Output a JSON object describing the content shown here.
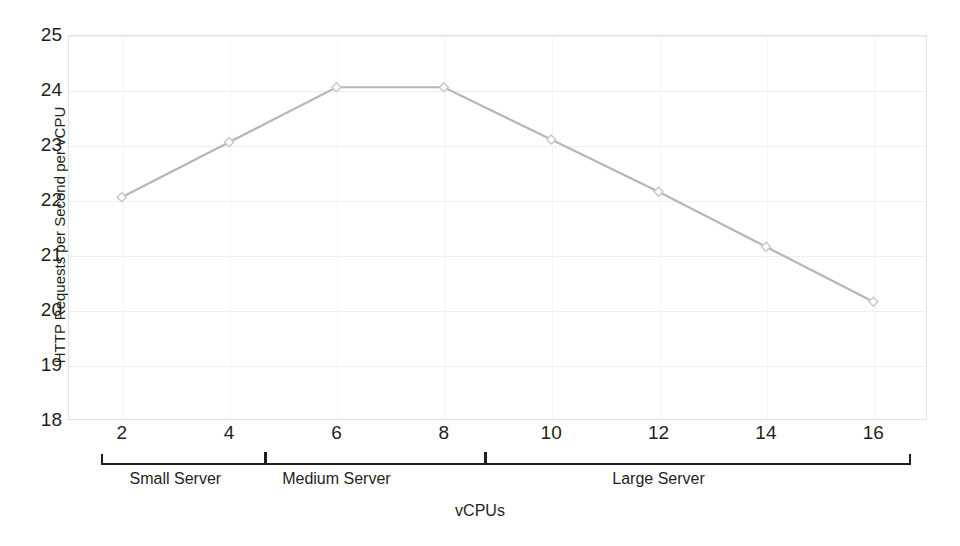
{
  "chart_data": {
    "type": "line",
    "title": "",
    "subtitle": "",
    "xlabel": "vCPUs",
    "ylabel": "HTTP Requests per Second per vCPU",
    "x": [
      2,
      4,
      6,
      8,
      10,
      12,
      14,
      16
    ],
    "values": [
      22.05,
      23.05,
      24.05,
      24.05,
      23.1,
      22.15,
      21.15,
      20.15
    ],
    "series": [
      {
        "name": "HTTP Requests per Second per vCPU",
        "values": [
          22.05,
          23.05,
          24.05,
          24.05,
          23.1,
          22.15,
          21.15,
          20.15
        ]
      }
    ],
    "xtick_labels": [
      "2",
      "4",
      "6",
      "8",
      "10",
      "12",
      "14",
      "16"
    ],
    "ytick_labels": [
      "25",
      "24",
      "23",
      "22",
      "21",
      "20",
      "19",
      "18"
    ],
    "ytick_values": [
      25,
      24,
      23,
      22,
      21,
      20,
      19,
      18
    ],
    "xlim": [
      1,
      17
    ],
    "ylim": [
      18,
      25
    ],
    "grid": true,
    "legend": "none",
    "line_color": "#b6b6b6",
    "marker_color": "#c9c9c9",
    "groups": [
      {
        "label": "Small Server",
        "x_start": 2,
        "x_end": 4
      },
      {
        "label": "Medium Server",
        "x_start": 4,
        "x_end": 8
      },
      {
        "label": "Large Server",
        "x_start": 8,
        "x_end": 16
      }
    ]
  },
  "axis": {
    "y_title": "HTTP Requests per Second per vCPU",
    "x_title": "vCPUs"
  }
}
